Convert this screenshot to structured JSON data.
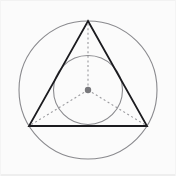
{
  "canvas": {
    "width": 176,
    "height": 176,
    "background_color": "#fbfbfb",
    "border_color": "#f0f0f0"
  },
  "figure": {
    "center_label": "center point",
    "center": {
      "x": 88,
      "y": 90
    }
  },
  "chart_data": {
    "type": "scatter",
    "title": "Equilateral triangle with circumscribed and inscribed circles",
    "xlabel": "",
    "ylabel": "",
    "xlim": [
      0,
      176
    ],
    "ylim": [
      0,
      176
    ],
    "grid": false,
    "legend": "none",
    "shapes": [
      {
        "name": "circumcircle",
        "kind": "circle",
        "cx": 88,
        "cy": 90,
        "r": 69,
        "stroke": "#8a8a8e",
        "stroke_width": 1.1,
        "fill": "none",
        "dash": "solid"
      },
      {
        "name": "incircle",
        "kind": "circle",
        "cx": 88,
        "cy": 90,
        "r": 34.5,
        "stroke": "#8a8a8e",
        "stroke_width": 1.1,
        "fill": "none",
        "dash": "solid"
      },
      {
        "name": "equilateral-triangle",
        "kind": "polygon",
        "points": [
          [
            88,
            21
          ],
          [
            147,
            126
          ],
          [
            29,
            126
          ]
        ],
        "stroke": "#1b1b1f",
        "stroke_width": 1.8,
        "fill": "none",
        "dash": "solid"
      },
      {
        "name": "radius-to-apex",
        "kind": "line",
        "x1": 88,
        "y1": 90,
        "x2": 88,
        "y2": 21,
        "stroke": "#9a9a9e",
        "stroke_width": 1.1,
        "dash": "2,2.6"
      },
      {
        "name": "radius-to-bottom-left",
        "kind": "line",
        "x1": 88,
        "y1": 90,
        "x2": 29,
        "y2": 126,
        "stroke": "#9a9a9e",
        "stroke_width": 1.1,
        "dash": "2,2.6"
      },
      {
        "name": "radius-to-bottom-right",
        "kind": "line",
        "x1": 88,
        "y1": 90,
        "x2": 147,
        "y2": 126,
        "stroke": "#9a9a9e",
        "stroke_width": 1.1,
        "dash": "2,2.6"
      },
      {
        "name": "center-dot",
        "kind": "point",
        "cx": 88,
        "cy": 90,
        "r": 3.2,
        "fill": "#78787c",
        "stroke": "none"
      }
    ],
    "points": [
      {
        "label": "apex",
        "x": 88,
        "y": 21
      },
      {
        "label": "bottom-right-vertex",
        "x": 147,
        "y": 126
      },
      {
        "label": "bottom-left-vertex",
        "x": 29,
        "y": 126
      },
      {
        "label": "center",
        "x": 88,
        "y": 90
      }
    ]
  }
}
